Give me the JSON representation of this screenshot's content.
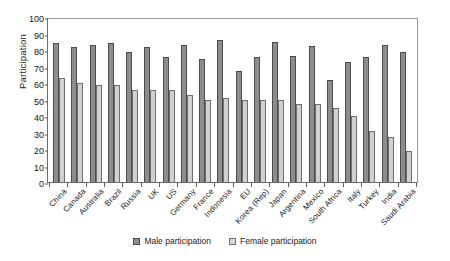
{
  "chart_data": {
    "type": "bar",
    "title": "",
    "xlabel": "",
    "ylabel": "Participation",
    "ylim": [
      0,
      100
    ],
    "ytick_step": 10,
    "yticks": [
      0,
      10,
      20,
      30,
      40,
      50,
      60,
      70,
      80,
      90,
      100
    ],
    "grid": false,
    "legend_position": "bottom",
    "categories": [
      "China",
      "Canada",
      "Australia",
      "Brazil",
      "Russia",
      "UK",
      "US",
      "Germany",
      "France",
      "Indonesia",
      "EU",
      "Korea (Rep)",
      "Japan",
      "Argentina",
      "Mexico",
      "South Africa",
      "Italy",
      "Turkey",
      "India",
      "Saudi Arabia"
    ],
    "series": [
      {
        "name": "Male participation",
        "color": "#8d8d8d",
        "values": [
          84,
          82,
          83,
          84.5,
          78.5,
          82,
          76,
          83,
          74.5,
          86,
          67,
          75.5,
          85,
          76.5,
          82.5,
          62,
          73,
          76,
          83,
          79
        ]
      },
      {
        "name": "Female participation",
        "color": "#d0d0d0",
        "values": [
          63,
          60,
          59,
          58.5,
          56,
          55.5,
          55.5,
          53,
          50,
          51,
          50,
          50,
          49.5,
          47,
          47,
          45,
          40,
          31,
          27,
          19
        ]
      }
    ]
  },
  "legend": {
    "items": [
      {
        "label": "Male participation"
      },
      {
        "label": "Female participation"
      }
    ]
  }
}
